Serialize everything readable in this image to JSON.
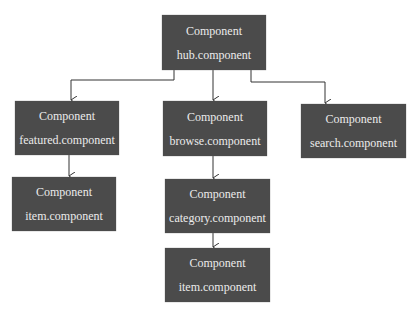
{
  "diagram": {
    "title_fragment": "",
    "colors": {
      "node_fill": "#4b4b4b",
      "node_text": "#ececec",
      "edge": "#333333",
      "background": "#ffffff"
    },
    "nodes": [
      {
        "id": "hub",
        "kind": "Component",
        "name": "hub.component",
        "x": 162,
        "y": 15,
        "w": 104,
        "h": 55
      },
      {
        "id": "featured",
        "kind": "Component",
        "name": "featured.component",
        "x": 15,
        "y": 101,
        "w": 104,
        "h": 54
      },
      {
        "id": "browse",
        "kind": "Component",
        "name": "browse.component",
        "x": 163,
        "y": 101,
        "w": 104,
        "h": 55
      },
      {
        "id": "search",
        "kind": "Component",
        "name": "search.component",
        "x": 301,
        "y": 104,
        "w": 105,
        "h": 54
      },
      {
        "id": "item1",
        "kind": "Component",
        "name": "item.component",
        "x": 12,
        "y": 177,
        "w": 104,
        "h": 54
      },
      {
        "id": "category",
        "kind": "Component",
        "name": "category.component",
        "x": 165,
        "y": 179,
        "w": 105,
        "h": 54
      },
      {
        "id": "item2",
        "kind": "Component",
        "name": "item.component",
        "x": 165,
        "y": 248,
        "w": 105,
        "h": 54
      }
    ],
    "edges": [
      {
        "from": "hub",
        "to": "featured"
      },
      {
        "from": "hub",
        "to": "browse"
      },
      {
        "from": "hub",
        "to": "search"
      },
      {
        "from": "featured",
        "to": "item1"
      },
      {
        "from": "browse",
        "to": "category"
      },
      {
        "from": "category",
        "to": "item2"
      }
    ]
  }
}
